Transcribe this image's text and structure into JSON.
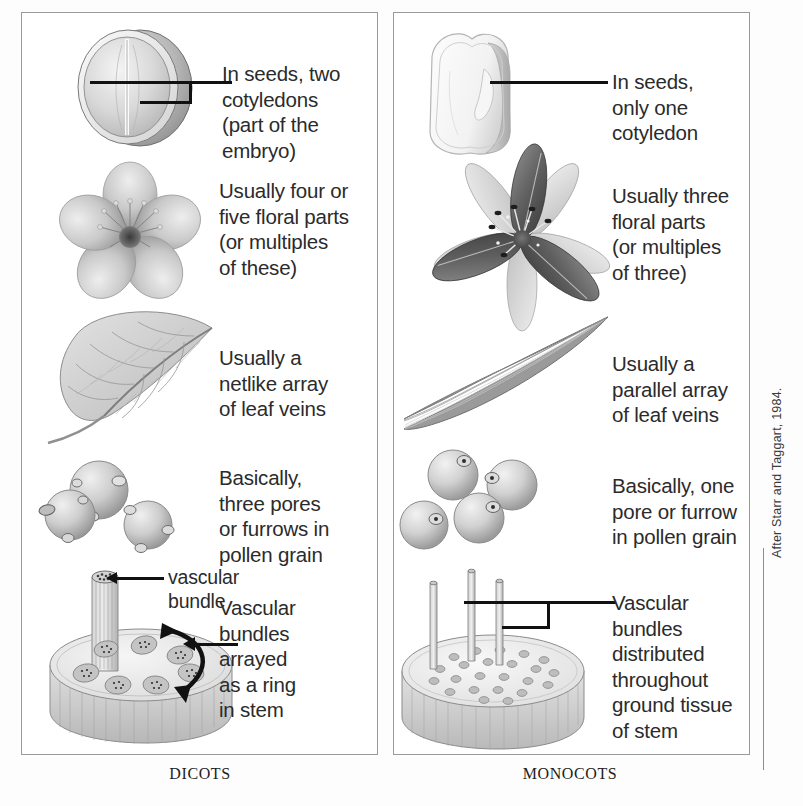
{
  "figure": {
    "attribution": "After Starr and Taggart, 1984.",
    "panels": [
      {
        "key": "dicots",
        "label": "DICOTS",
        "rows": [
          {
            "key": "seed",
            "art": "dicot-seed-illustration",
            "caption": [
              "In seeds, two",
              "cotyledons",
              "(part of the",
              "embryo)"
            ]
          },
          {
            "key": "flower",
            "art": "dicot-flower-illustration",
            "caption": [
              "Usually four or",
              "five floral parts",
              "(or multiples",
              "of these)"
            ]
          },
          {
            "key": "leaf",
            "art": "dicot-leaf-illustration",
            "caption": [
              "Usually a",
              "netlike array",
              "of leaf veins"
            ]
          },
          {
            "key": "pollen",
            "art": "dicot-pollen-illustration",
            "caption": [
              "Basically,",
              "three pores",
              "or furrows in",
              "pollen grain"
            ]
          },
          {
            "key": "stem",
            "art": "dicot-stem-illustration",
            "inline_label": [
              "vascular",
              "bundle"
            ],
            "caption": [
              "Vascular",
              "bundles",
              "arrayed",
              "as a ring",
              "in stem"
            ]
          }
        ]
      },
      {
        "key": "monocots",
        "label": "MONOCOTS",
        "rows": [
          {
            "key": "seed",
            "art": "monocot-seed-illustration",
            "caption": [
              "In seeds,",
              "only one",
              "cotyledon"
            ]
          },
          {
            "key": "flower",
            "art": "monocot-flower-illustration",
            "caption": [
              "Usually three",
              "floral parts",
              "(or multiples",
              "of three)"
            ]
          },
          {
            "key": "leaf",
            "art": "monocot-leaf-illustration",
            "caption": [
              "Usually a",
              "parallel array",
              "of leaf veins"
            ]
          },
          {
            "key": "pollen",
            "art": "monocot-pollen-illustration",
            "caption": [
              "Basically, one",
              "pore or furrow",
              "in pollen grain"
            ]
          },
          {
            "key": "stem",
            "art": "monocot-stem-illustration",
            "caption": [
              "Vascular",
              "bundles",
              "distributed",
              "throughout",
              "ground tissue",
              "of stem"
            ]
          }
        ]
      }
    ]
  },
  "colors": {
    "panel_border": "#9a9a9a",
    "text": "#2b2b2b",
    "leader_line": "#111111",
    "background": "#ffffff"
  }
}
